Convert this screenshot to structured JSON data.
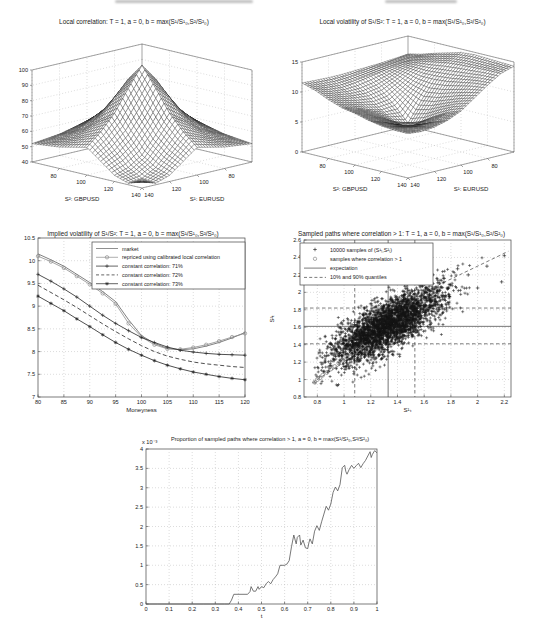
{
  "page": {
    "background": "#ffffff"
  },
  "chart_data": [
    {
      "type": "surface",
      "title": "Local correlation: T = 1, a = 0, b = max(S¹/S¹₀,S²/S²₀)",
      "xlabel": "S²: GBPUSD",
      "ylabel": "S¹: EURUSD",
      "xrange": [
        60,
        140
      ],
      "yrange": [
        60,
        140
      ],
      "xticks": [
        80,
        100,
        120,
        140
      ],
      "yticks": [
        140,
        120,
        100,
        80
      ],
      "zlim": [
        40,
        100
      ],
      "zticks": [
        40,
        50,
        60,
        70,
        80,
        90,
        100
      ],
      "z_grid": [
        [
          52,
          53,
          54,
          56,
          58,
          56,
          54,
          53,
          52
        ],
        [
          53,
          55,
          58,
          62,
          66,
          62,
          58,
          55,
          53
        ],
        [
          54,
          58,
          63,
          70,
          76,
          70,
          63,
          58,
          54
        ],
        [
          56,
          62,
          70,
          82,
          92,
          82,
          70,
          62,
          56
        ],
        [
          58,
          66,
          76,
          92,
          103,
          90,
          76,
          66,
          58
        ],
        [
          56,
          62,
          70,
          82,
          90,
          76,
          64,
          56,
          51
        ],
        [
          54,
          58,
          63,
          70,
          76,
          64,
          53,
          47,
          44
        ],
        [
          53,
          55,
          58,
          62,
          66,
          56,
          47,
          42,
          41
        ],
        [
          52,
          53,
          54,
          56,
          58,
          51,
          44,
          41,
          44
        ]
      ]
    },
    {
      "type": "surface",
      "title": "Local volatility of S¹/S²: T = 1, a = 0, b = max(S¹/S¹₀,S²/S²₀)",
      "xlabel": "S²: GBPUSD",
      "ylabel": "S¹: EURUSD",
      "xrange": [
        60,
        140
      ],
      "yrange": [
        60,
        140
      ],
      "xticks": [
        80,
        100,
        120,
        140
      ],
      "yticks": [
        140,
        120,
        100,
        80
      ],
      "zlim": [
        0,
        15
      ],
      "zticks": [
        0,
        5,
        10,
        15
      ],
      "z_grid": [
        [
          12.0,
          11.8,
          11.6,
          11.5,
          11.4,
          11.3,
          11.3,
          11.4,
          11.5
        ],
        [
          12.5,
          12.0,
          11.6,
          11.2,
          10.8,
          10.4,
          10.2,
          10.4,
          10.8
        ],
        [
          13.2,
          12.4,
          11.4,
          10.2,
          9.2,
          8.8,
          9.0,
          9.4,
          9.8
        ],
        [
          13.8,
          12.8,
          11.0,
          9.0,
          7.2,
          7.0,
          7.6,
          8.4,
          9.0
        ],
        [
          14.4,
          13.2,
          11.0,
          8.0,
          4.8,
          5.6,
          6.8,
          7.8,
          8.6
        ],
        [
          14.6,
          13.4,
          11.2,
          8.4,
          5.6,
          5.2,
          6.2,
          7.2,
          8.0
        ],
        [
          14.5,
          13.5,
          11.6,
          9.2,
          7.0,
          6.2,
          6.4,
          7.0,
          7.6
        ],
        [
          14.4,
          13.6,
          12.0,
          10.0,
          8.2,
          7.2,
          7.0,
          7.2,
          7.4
        ],
        [
          14.3,
          13.6,
          12.2,
          10.6,
          9.0,
          8.0,
          7.4,
          7.2,
          7.4
        ]
      ]
    },
    {
      "type": "line",
      "title": "Implied volatility of S¹/S²: T = 1, a = 0, b = max(S¹/S¹₀,S²/S²₀)",
      "xlabel": "Moneyness",
      "xlim": [
        80,
        120
      ],
      "ylim": [
        7,
        10.5
      ],
      "xticks": [
        80,
        85,
        90,
        95,
        100,
        105,
        110,
        115,
        120
      ],
      "yticks": [
        7,
        7.5,
        8,
        8.5,
        9,
        9.5,
        10,
        10.5
      ],
      "x": [
        80,
        82.5,
        85,
        87.5,
        90,
        92.5,
        95,
        97.5,
        100,
        102.5,
        105,
        107.5,
        110,
        112.5,
        115,
        117.5,
        120
      ],
      "series": [
        {
          "name": "market",
          "line": "solid",
          "marker": "none",
          "color": "#606060",
          "values": [
            10.15,
            10.02,
            9.88,
            9.7,
            9.52,
            9.32,
            9.1,
            8.7,
            8.35,
            8.18,
            8.07,
            8.04,
            8.06,
            8.12,
            8.2,
            8.3,
            8.42
          ]
        },
        {
          "name": "repriced using calibrated local correlation",
          "line": "solid",
          "marker": "circle",
          "color": "#8c8c8c",
          "values": [
            10.1,
            9.98,
            9.84,
            9.66,
            9.48,
            9.28,
            9.05,
            8.62,
            8.32,
            8.15,
            8.06,
            8.05,
            8.09,
            8.15,
            8.23,
            8.32,
            8.4
          ]
        },
        {
          "name": "constant correlation: 71%",
          "line": "solid",
          "marker": "plus",
          "color": "#222222",
          "values": [
            9.7,
            9.55,
            9.38,
            9.2,
            9.0,
            8.8,
            8.62,
            8.46,
            8.31,
            8.2,
            8.1,
            8.03,
            7.99,
            7.96,
            7.94,
            7.93,
            7.92
          ]
        },
        {
          "name": "constant correlation: 72%",
          "line": "dashed",
          "marker": "none",
          "color": "#222222",
          "values": [
            9.46,
            9.3,
            9.14,
            8.97,
            8.79,
            8.61,
            8.44,
            8.28,
            8.13,
            8.0,
            7.9,
            7.83,
            7.77,
            7.73,
            7.7,
            7.67,
            7.65
          ]
        },
        {
          "name": "constant correlation: 73%",
          "line": "solid",
          "marker": "star",
          "color": "#222222",
          "values": [
            9.22,
            9.06,
            8.9,
            8.72,
            8.55,
            8.37,
            8.2,
            8.05,
            7.92,
            7.8,
            7.7,
            7.62,
            7.55,
            7.5,
            7.45,
            7.41,
            7.38
          ]
        }
      ]
    },
    {
      "type": "scatter",
      "title": "Sampled paths where correlation > 1: T = 1, a = 0, b = max(S¹/S¹₀,S²/S²₀)",
      "xlabel": "S¹ₜ",
      "ylabel": "S²ₜ",
      "xlim": [
        0.7,
        2.25
      ],
      "ylim": [
        0.8,
        2.6
      ],
      "xticks": [
        0.8,
        1,
        1.2,
        1.4,
        1.6,
        1.8,
        2,
        2.2
      ],
      "yticks": [
        0.8,
        1,
        1.2,
        1.4,
        1.6,
        1.8,
        2,
        2.2,
        2.4,
        2.6
      ],
      "cloud": {
        "n": 3200,
        "center": [
          1.32,
          1.62
        ],
        "sd": [
          0.21,
          0.22
        ],
        "rho": 0.76,
        "seed": 42
      },
      "expectation": {
        "x": 1.33,
        "y": 1.61
      },
      "quantiles": {
        "x": [
          1.08,
          1.53
        ],
        "y": [
          1.41,
          1.82
        ]
      },
      "quantile_diagonals": [
        [
          [
            1.62,
            2.02
          ],
          [
            2.23,
            2.47
          ]
        ],
        [
          [
            0.76,
            0.96
          ],
          [
            1.18,
            1.38
          ]
        ]
      ],
      "correlation_gt1_samples": [
        [
          0.78,
          0.97
        ],
        [
          0.8,
          1.0
        ],
        [
          0.82,
          1.02
        ],
        [
          0.84,
          1.05
        ],
        [
          0.87,
          1.08
        ],
        [
          0.9,
          1.12
        ],
        [
          0.93,
          1.15
        ],
        [
          0.96,
          1.19
        ],
        [
          0.99,
          1.22
        ],
        [
          1.02,
          1.26
        ],
        [
          1.06,
          1.3
        ],
        [
          1.1,
          1.34
        ],
        [
          1.14,
          1.38
        ]
      ],
      "outlier_samples": [
        [
          2.2,
          2.42
        ],
        [
          2.07,
          2.3
        ],
        [
          1.93,
          2.2
        ],
        [
          1.85,
          2.27
        ],
        [
          2.18,
          2.12
        ],
        [
          1.75,
          2.16
        ],
        [
          1.62,
          2.05
        ],
        [
          2.0,
          2.05
        ]
      ],
      "legend": [
        {
          "marker": "plus",
          "label": "10000 samples of (S¹ₜ,S²ₜ)"
        },
        {
          "marker": "circle",
          "label": "samples where correlation > 1"
        },
        {
          "marker": "solid-line",
          "label": "expectation"
        },
        {
          "marker": "dashed-line",
          "label": "10% and 90% quantiles"
        }
      ]
    },
    {
      "type": "line",
      "title": "Proportion of sampled paths where correlation > 1, a = 0, b = max(S¹/S¹₀,S²/S²₀)",
      "xlabel": "t",
      "y_multiplier": "x 10⁻³",
      "xlim": [
        0,
        1
      ],
      "ylim": [
        0,
        4
      ],
      "xticks": [
        0,
        0.1,
        0.2,
        0.3,
        0.4,
        0.5,
        0.6,
        0.7,
        0.8,
        0.9,
        1
      ],
      "yticks": [
        0,
        0.5,
        1,
        1.5,
        2,
        2.5,
        3,
        3.5,
        4
      ],
      "line_color": "#555555",
      "points": [
        [
          0,
          0
        ],
        [
          0.05,
          0
        ],
        [
          0.1,
          0
        ],
        [
          0.15,
          0
        ],
        [
          0.2,
          0
        ],
        [
          0.25,
          0
        ],
        [
          0.3,
          0
        ],
        [
          0.34,
          0
        ],
        [
          0.36,
          0
        ],
        [
          0.37,
          0.1
        ],
        [
          0.38,
          0.25
        ],
        [
          0.42,
          0.25
        ],
        [
          0.44,
          0.25
        ],
        [
          0.45,
          0.32
        ],
        [
          0.455,
          0.45
        ],
        [
          0.465,
          0.33
        ],
        [
          0.475,
          0.33
        ],
        [
          0.485,
          0.45
        ],
        [
          0.49,
          0.38
        ],
        [
          0.5,
          0.45
        ],
        [
          0.51,
          0.42
        ],
        [
          0.52,
          0.52
        ],
        [
          0.53,
          0.58
        ],
        [
          0.54,
          0.52
        ],
        [
          0.55,
          0.63
        ],
        [
          0.56,
          0.7
        ],
        [
          0.57,
          0.78
        ],
        [
          0.58,
          1.0
        ],
        [
          0.6,
          1.0
        ],
        [
          0.61,
          1.03
        ],
        [
          0.62,
          1.12
        ],
        [
          0.63,
          1.48
        ],
        [
          0.64,
          1.78
        ],
        [
          0.65,
          1.55
        ],
        [
          0.655,
          1.72
        ],
        [
          0.665,
          1.78
        ],
        [
          0.67,
          1.52
        ],
        [
          0.68,
          1.65
        ],
        [
          0.69,
          1.45
        ],
        [
          0.7,
          1.43
        ],
        [
          0.705,
          1.58
        ],
        [
          0.71,
          1.68
        ],
        [
          0.72,
          1.55
        ],
        [
          0.73,
          1.88
        ],
        [
          0.74,
          2.02
        ],
        [
          0.75,
          1.9
        ],
        [
          0.76,
          2.12
        ],
        [
          0.77,
          2.32
        ],
        [
          0.78,
          2.52
        ],
        [
          0.79,
          2.42
        ],
        [
          0.8,
          2.58
        ],
        [
          0.81,
          2.88
        ],
        [
          0.82,
          3.02
        ],
        [
          0.83,
          2.92
        ],
        [
          0.84,
          3.08
        ],
        [
          0.85,
          3.52
        ],
        [
          0.86,
          3.58
        ],
        [
          0.865,
          3.42
        ],
        [
          0.87,
          3.35
        ],
        [
          0.88,
          3.48
        ],
        [
          0.89,
          3.58
        ],
        [
          0.9,
          3.5
        ],
        [
          0.91,
          3.57
        ],
        [
          0.92,
          3.63
        ],
        [
          0.93,
          3.52
        ],
        [
          0.94,
          3.62
        ],
        [
          0.95,
          3.7
        ],
        [
          0.96,
          3.82
        ],
        [
          0.97,
          3.93
        ],
        [
          0.975,
          3.78
        ],
        [
          0.98,
          3.86
        ],
        [
          0.99,
          3.96
        ],
        [
          1,
          3.9
        ]
      ]
    }
  ]
}
